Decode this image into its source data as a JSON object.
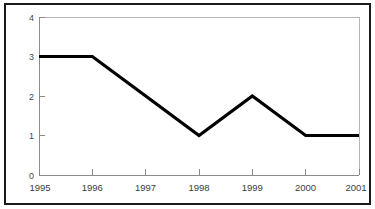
{
  "chart_data": {
    "type": "line",
    "title": "",
    "subtitle": "",
    "xlabel": "",
    "ylabel": "",
    "categories": [
      "1995",
      "1996",
      "1997",
      "1998",
      "1999",
      "2000",
      "2001"
    ],
    "values": [
      3,
      3,
      2,
      1,
      2,
      1,
      1
    ],
    "series": [
      {
        "name": "",
        "values": [
          3,
          3,
          2,
          1,
          2,
          1,
          1
        ]
      }
    ],
    "x_tick_labels": [
      "1995",
      "1996",
      "1997",
      "1998",
      "1999",
      "2000",
      "2001"
    ],
    "y_tick_labels": [
      "0",
      "1",
      "2",
      "3",
      "4"
    ],
    "y_ticks": [
      0,
      1,
      2,
      3,
      4
    ],
    "ylim": [
      0,
      4
    ],
    "xlim": [
      "1995",
      "2001"
    ],
    "grid": false,
    "legend": false,
    "legend_position": "none",
    "markers": false,
    "line_color": "#000000",
    "axis_color": "#8c8c8c",
    "frame_color": "#1a1a1a",
    "background_color": "#ffffff",
    "annotations": []
  }
}
